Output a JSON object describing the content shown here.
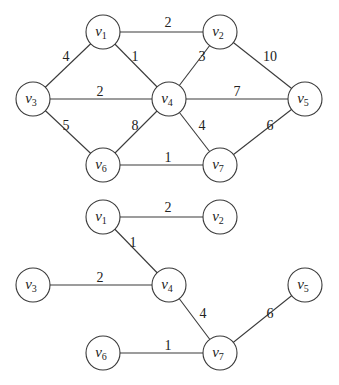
{
  "graphs": [
    {
      "name": "weighted-graph",
      "nodes": [
        {
          "id": "v1",
          "base": "v",
          "sub": "1",
          "x": 103,
          "y": 32
        },
        {
          "id": "v2",
          "base": "v",
          "sub": "2",
          "x": 220,
          "y": 32
        },
        {
          "id": "v3",
          "base": "v",
          "sub": "3",
          "x": 33,
          "y": 99
        },
        {
          "id": "v4",
          "base": "v",
          "sub": "4",
          "x": 169,
          "y": 99
        },
        {
          "id": "v5",
          "base": "v",
          "sub": "5",
          "x": 305,
          "y": 99
        },
        {
          "id": "v6",
          "base": "v",
          "sub": "6",
          "x": 103,
          "y": 165
        },
        {
          "id": "v7",
          "base": "v",
          "sub": "7",
          "x": 220,
          "y": 165
        }
      ],
      "edges": [
        {
          "from": "v1",
          "to": "v2",
          "weight": "2",
          "lx": 168,
          "ly": 27
        },
        {
          "from": "v1",
          "to": "v3",
          "weight": "4",
          "lx": 66,
          "ly": 61
        },
        {
          "from": "v1",
          "to": "v4",
          "weight": "1",
          "lx": 135,
          "ly": 61
        },
        {
          "from": "v2",
          "to": "v4",
          "weight": "3",
          "lx": 202,
          "ly": 61
        },
        {
          "from": "v2",
          "to": "v5",
          "weight": "10",
          "lx": 270,
          "ly": 61
        },
        {
          "from": "v3",
          "to": "v4",
          "weight": "2",
          "lx": 100,
          "ly": 96
        },
        {
          "from": "v4",
          "to": "v5",
          "weight": "7",
          "lx": 237,
          "ly": 96
        },
        {
          "from": "v3",
          "to": "v6",
          "weight": "5",
          "lx": 66,
          "ly": 130
        },
        {
          "from": "v4",
          "to": "v6",
          "weight": "8",
          "lx": 135,
          "ly": 130
        },
        {
          "from": "v4",
          "to": "v7",
          "weight": "4",
          "lx": 202,
          "ly": 130
        },
        {
          "from": "v5",
          "to": "v7",
          "weight": "6",
          "lx": 270,
          "ly": 130
        },
        {
          "from": "v6",
          "to": "v7",
          "weight": "1",
          "lx": 168,
          "ly": 162
        }
      ]
    },
    {
      "name": "minimum-spanning-tree",
      "nodes": [
        {
          "id": "v1",
          "base": "v",
          "sub": "1",
          "x": 103,
          "y": 217
        },
        {
          "id": "v2",
          "base": "v",
          "sub": "2",
          "x": 220,
          "y": 217
        },
        {
          "id": "v3",
          "base": "v",
          "sub": "3",
          "x": 33,
          "y": 285
        },
        {
          "id": "v4",
          "base": "v",
          "sub": "4",
          "x": 169,
          "y": 285
        },
        {
          "id": "v5",
          "base": "v",
          "sub": "5",
          "x": 305,
          "y": 285
        },
        {
          "id": "v6",
          "base": "v",
          "sub": "6",
          "x": 103,
          "y": 353
        },
        {
          "id": "v7",
          "base": "v",
          "sub": "7",
          "x": 220,
          "y": 353
        }
      ],
      "edges": [
        {
          "from": "v1",
          "to": "v2",
          "weight": "2",
          "lx": 168,
          "ly": 212
        },
        {
          "from": "v1",
          "to": "v4",
          "weight": "1",
          "lx": 133,
          "ly": 247
        },
        {
          "from": "v3",
          "to": "v4",
          "weight": "2",
          "lx": 100,
          "ly": 282
        },
        {
          "from": "v4",
          "to": "v7",
          "weight": "4",
          "lx": 203,
          "ly": 318
        },
        {
          "from": "v5",
          "to": "v7",
          "weight": "6",
          "lx": 270,
          "ly": 318
        },
        {
          "from": "v6",
          "to": "v7",
          "weight": "1",
          "lx": 168,
          "ly": 350
        }
      ]
    }
  ],
  "node_radius": 17
}
